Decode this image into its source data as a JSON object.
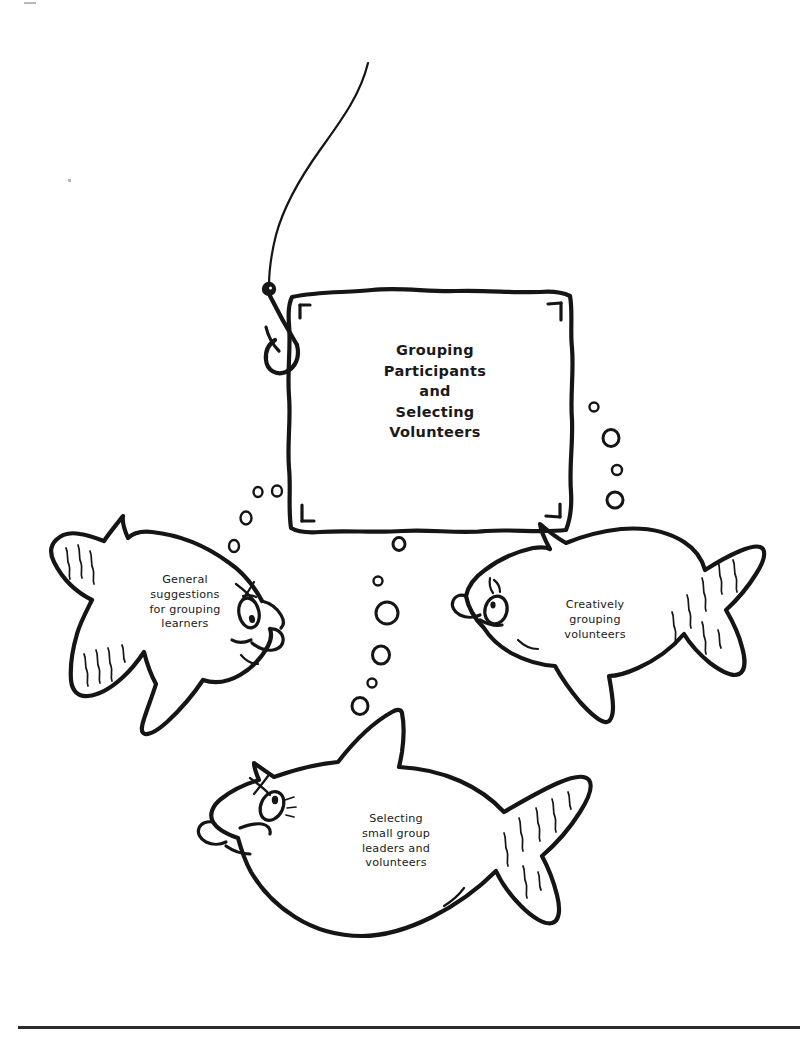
{
  "page": {
    "background_color": "#ffffff",
    "ink_color": "#151515",
    "width": 810,
    "height": 1039,
    "kind": "hand-drawn-worksheet-cover"
  },
  "sign": {
    "name": "bait-square-sign",
    "title": "Grouping\nParticipants\nand\nSelecting\nVolunteers",
    "title_lines": [
      "Grouping",
      "Participants",
      "and",
      "Selecting",
      "Volunteers"
    ],
    "corner_marks": [
      "top-left",
      "top-right",
      "bottom-left",
      "bottom-right"
    ]
  },
  "hook": {
    "name": "fishing-hook",
    "has_line": true,
    "has_knot_weight": true,
    "has_barb": true
  },
  "fish": [
    {
      "id": "left",
      "name": "fish-general-suggestions",
      "label": "General\nsuggestions\nfor grouping\nlearners",
      "label_lines": [
        "General",
        "suggestions",
        "for grouping",
        "learners"
      ],
      "facing": "right"
    },
    {
      "id": "right",
      "name": "fish-creatively-grouping",
      "label": "Creatively\ngrouping\nvolunteers",
      "label_lines": [
        "Creatively",
        "grouping",
        "volunteers"
      ],
      "facing": "left"
    },
    {
      "id": "bottom",
      "name": "fish-selecting-leaders",
      "label": "Selecting\nsmall group\nleaders and\nvolunteers",
      "label_lines": [
        "Selecting",
        "small group",
        "leaders and",
        "volunteers"
      ],
      "facing": "left"
    }
  ],
  "bubbles": {
    "name": "air-bubbles",
    "count": 17,
    "groups": [
      "left-of-sign",
      "below-sign-center",
      "right-of-sign"
    ]
  },
  "footer": {
    "name": "page-bottom-rule",
    "color": "#2b2b2b"
  }
}
